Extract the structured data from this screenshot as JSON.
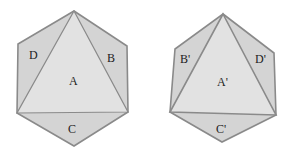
{
  "colors": {
    "outer_face": "#d4d4d4",
    "center_face": "#e2e2e2",
    "edge": "#8a8a8a",
    "label": "#222222",
    "background": "#ffffff"
  },
  "figures": [
    {
      "name": "original",
      "labels": {
        "center": "A",
        "right": "B",
        "bottom": "C",
        "left": "D"
      }
    },
    {
      "name": "transformed",
      "labels": {
        "center": "A'",
        "left": "B'",
        "bottom": "C'",
        "right": "D'"
      }
    }
  ]
}
